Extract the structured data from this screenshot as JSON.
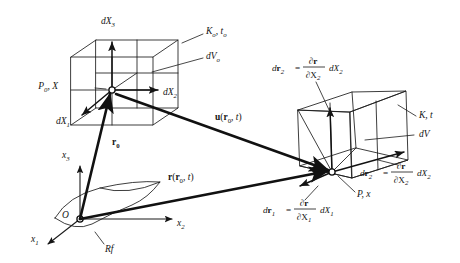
{
  "figure": {
    "domain_kind": "diagram",
    "background_color": "#ffffff",
    "ink_color": "#141414"
  },
  "coordinate_frame": {
    "origin_label": "O",
    "axis_x1": "x",
    "axis_x1_sub": "1",
    "axis_x2": "x",
    "axis_x2_sub": "2",
    "axis_x3": "x",
    "axis_x3_sub": "3",
    "reference_surface_label": "Rf"
  },
  "reference_configuration": {
    "point_label": "P",
    "point_sub": "0",
    "point_coord": ", X",
    "config_label": "K",
    "config_sub": "o",
    "config_time": ", t",
    "config_time_sub": "o",
    "volume_label": "dV",
    "volume_sub": "o",
    "edge_1": "dX",
    "edge_1_sub": "1",
    "edge_2": "dX",
    "edge_2_sub": "2",
    "edge_3": "dX",
    "edge_3_sub": "3"
  },
  "current_configuration": {
    "point_label": "P, x",
    "config_label": "K, t",
    "volume_label": "dV"
  },
  "vectors": {
    "position_initial": "r",
    "position_initial_sub": "0",
    "displacement": "u",
    "displacement_arg_open": "(",
    "displacement_arg_r": "r",
    "displacement_arg_sub": "0",
    "displacement_arg_t": ", t",
    "displacement_arg_close": ")",
    "position_current": "r",
    "position_current_arg_open": "(",
    "position_current_arg_r": "r",
    "position_current_arg_sub": "0",
    "position_current_arg_t": ", t",
    "position_current_arg_close": ")"
  },
  "differential_equations": [
    {
      "id": "dr2-upper",
      "lhs_symbol": "d",
      "lhs_vector": "r",
      "lhs_sub": "2",
      "equals": "=",
      "numerator_d": "∂",
      "numerator_vector": "r",
      "denominator_d": "∂X",
      "denominator_sub": "2",
      "trailing": "dX",
      "trailing_sub": "2"
    },
    {
      "id": "dr2-lower",
      "lhs_symbol": "d",
      "lhs_vector": "r",
      "lhs_sub": "2",
      "equals": "=",
      "numerator_d": "∂",
      "numerator_vector": "r",
      "denominator_d": "∂X",
      "denominator_sub": "2",
      "trailing": "dX",
      "trailing_sub": "2"
    },
    {
      "id": "dr1",
      "lhs_symbol": "d",
      "lhs_vector": "r",
      "lhs_sub": "1",
      "equals": "=",
      "numerator_d": "∂",
      "numerator_vector": "r",
      "denominator_d": "∂X",
      "denominator_sub": "1",
      "trailing": "dX",
      "trailing_sub": "1"
    }
  ]
}
